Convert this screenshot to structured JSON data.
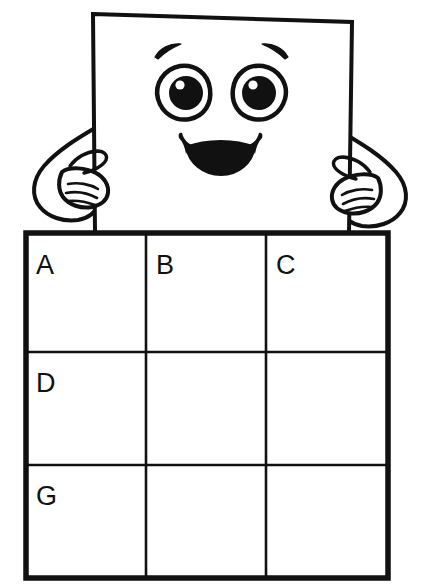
{
  "illustration": {
    "title": "Cartoon square character holding a 3x3 grid",
    "style": "black-and-white line art",
    "colors": {
      "ink": "#111111",
      "paper": "#ffffff",
      "fill_black": "#111111",
      "highlight": "#ffffff"
    },
    "character": {
      "name": "square-character",
      "body_shape": "square",
      "face_parts": [
        "left-eyebrow",
        "right-eyebrow",
        "left-eye",
        "right-eye",
        "mouth"
      ],
      "expression": "smiling",
      "hands": [
        "left-hand",
        "right-hand"
      ],
      "arms": [
        "left-arm",
        "right-arm"
      ]
    }
  },
  "grid": {
    "rows": 3,
    "columns": 3,
    "cells": [
      [
        {
          "label": "A"
        },
        {
          "label": "B"
        },
        {
          "label": "C"
        }
      ],
      [
        {
          "label": "D"
        },
        {
          "label": ""
        },
        {
          "label": ""
        }
      ],
      [
        {
          "label": "G"
        },
        {
          "label": ""
        },
        {
          "label": ""
        }
      ]
    ]
  }
}
